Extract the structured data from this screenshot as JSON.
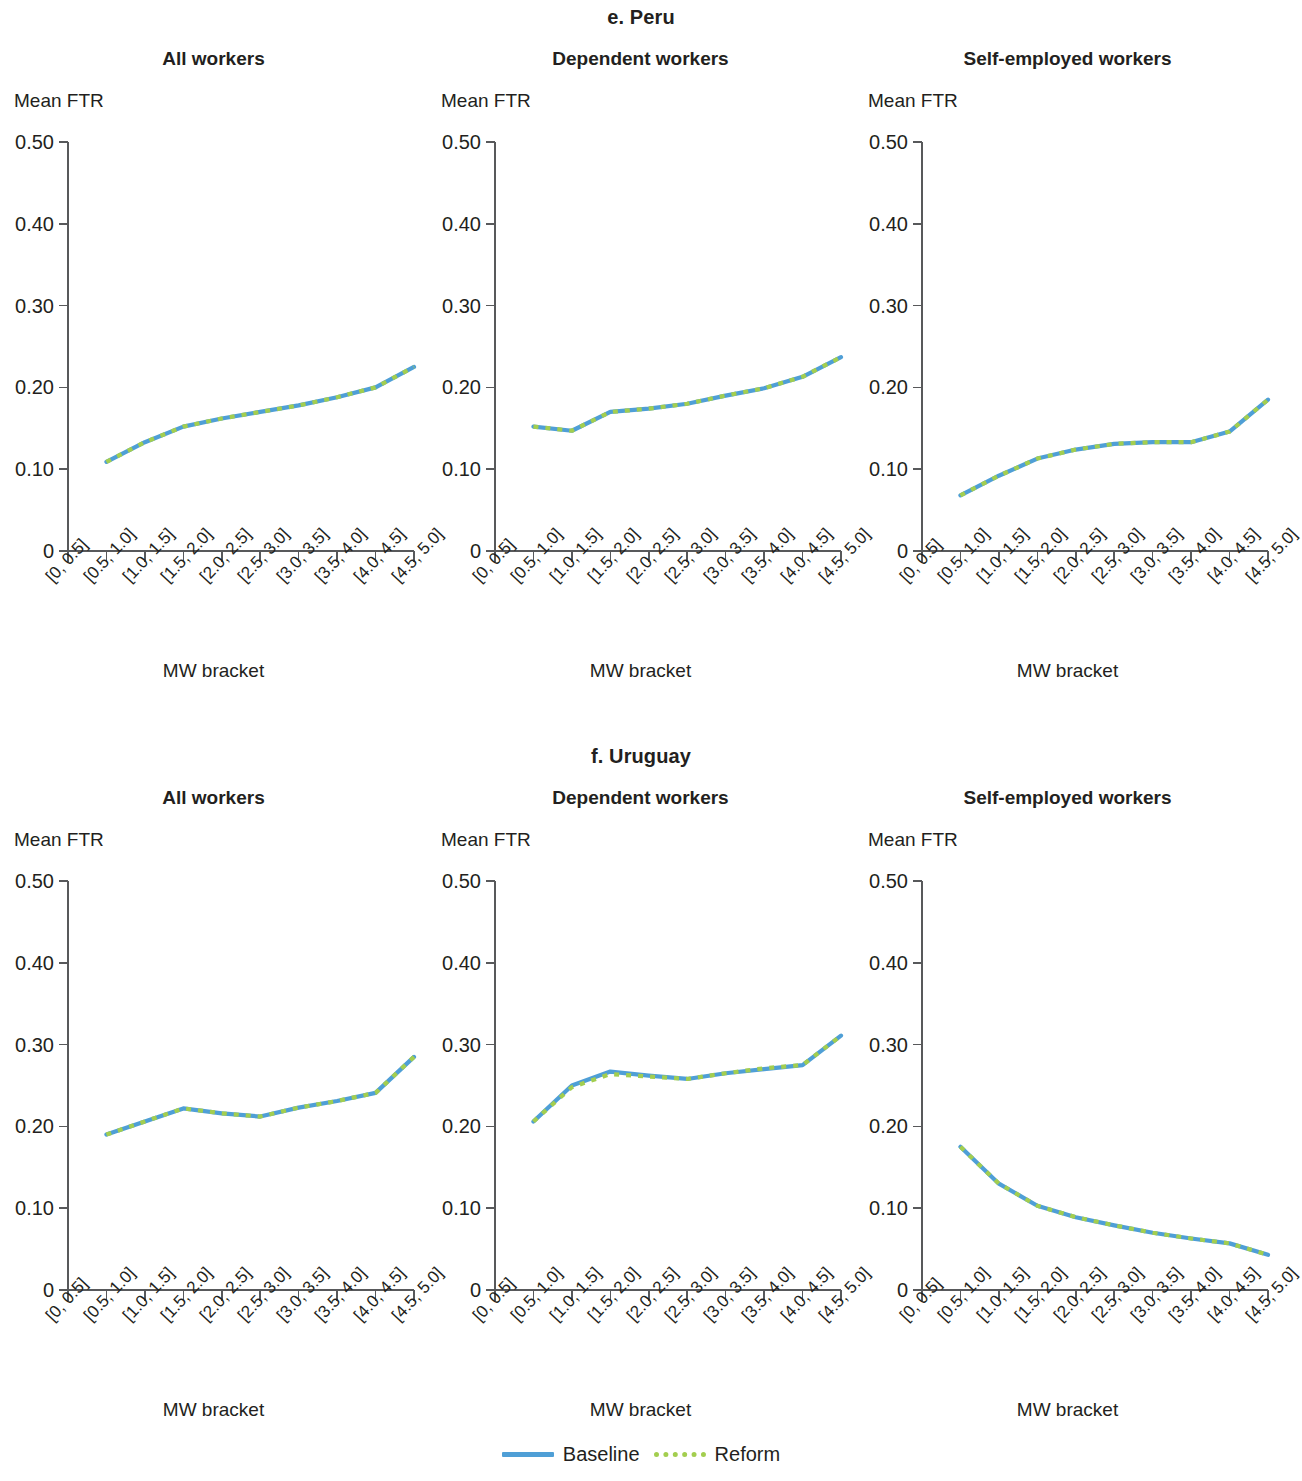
{
  "figure": {
    "sections": [
      {
        "id": "peru",
        "title": "e. Peru"
      },
      {
        "id": "uruguay",
        "title": "f. Uruguay"
      }
    ],
    "panel_titles": [
      "All workers",
      "Dependent workers",
      "Self-employed workers"
    ],
    "y_axis_label": "Mean FTR",
    "x_axis_label": "MW bracket",
    "y_ticks": [
      "0.50",
      "0.40",
      "0.30",
      "0.20",
      "0.10",
      "0"
    ],
    "x_ticks": [
      "[0, 0.5]",
      "[0.5, 1.0]",
      "[1.0, 1.5]",
      "[1.5, 2.0]",
      "[2.0, 2.5]",
      "[2.5, 3.0]",
      "[3.0, 3.5]",
      "[3.5, 4.0]",
      "[4.0, 4.5]",
      "[4.5, 5.0]"
    ],
    "legend": {
      "baseline_label": "Baseline",
      "reform_label": "Reform"
    },
    "colors": {
      "baseline": "#4f9fd6",
      "reform": "#a3ce4f",
      "axis": "#58595b",
      "text": "#231f20"
    }
  },
  "chart_data": [
    {
      "type": "line",
      "id": "peru-all",
      "title": "All workers",
      "section": "e. Peru",
      "xlabel": "MW bracket",
      "ylabel": "Mean FTR",
      "ylim": [
        0,
        0.5
      ],
      "yticks": [
        0,
        0.1,
        0.2,
        0.3,
        0.4,
        0.5
      ],
      "grid": false,
      "legend_position": "figure-bottom-center",
      "categories": [
        "[0, 0.5]",
        "[0.5, 1.0]",
        "[1.0, 1.5]",
        "[1.5, 2.0]",
        "[2.0, 2.5]",
        "[2.5, 3.0]",
        "[3.0, 3.5]",
        "[3.5, 4.0]",
        "[4.0, 4.5]",
        "[4.5, 5.0]"
      ],
      "series": [
        {
          "name": "Baseline",
          "values": [
            null,
            0.109,
            0.133,
            0.152,
            0.162,
            0.17,
            0.178,
            0.188,
            0.2,
            0.225
          ]
        },
        {
          "name": "Reform",
          "values": [
            null,
            0.109,
            0.133,
            0.152,
            0.162,
            0.17,
            0.178,
            0.188,
            0.2,
            0.225
          ]
        }
      ]
    },
    {
      "type": "line",
      "id": "peru-dependent",
      "title": "Dependent workers",
      "section": "e. Peru",
      "xlabel": "MW bracket",
      "ylabel": "Mean FTR",
      "ylim": [
        0,
        0.5
      ],
      "yticks": [
        0,
        0.1,
        0.2,
        0.3,
        0.4,
        0.5
      ],
      "grid": false,
      "legend_position": "figure-bottom-center",
      "categories": [
        "[0, 0.5]",
        "[0.5, 1.0]",
        "[1.0, 1.5]",
        "[1.5, 2.0]",
        "[2.0, 2.5]",
        "[2.5, 3.0]",
        "[3.0, 3.5]",
        "[3.5, 4.0]",
        "[4.0, 4.5]",
        "[4.5, 5.0]"
      ],
      "series": [
        {
          "name": "Baseline",
          "values": [
            null,
            0.152,
            0.147,
            0.17,
            0.174,
            0.18,
            0.19,
            0.199,
            0.213,
            0.237
          ]
        },
        {
          "name": "Reform",
          "values": [
            null,
            0.152,
            0.147,
            0.17,
            0.174,
            0.18,
            0.19,
            0.199,
            0.213,
            0.237
          ]
        }
      ]
    },
    {
      "type": "line",
      "id": "peru-self-employed",
      "title": "Self-employed workers",
      "section": "e. Peru",
      "xlabel": "MW bracket",
      "ylabel": "Mean FTR",
      "ylim": [
        0,
        0.5
      ],
      "yticks": [
        0,
        0.1,
        0.2,
        0.3,
        0.4,
        0.5
      ],
      "grid": false,
      "legend_position": "figure-bottom-center",
      "categories": [
        "[0, 0.5]",
        "[0.5, 1.0]",
        "[1.0, 1.5]",
        "[1.5, 2.0]",
        "[2.0, 2.5]",
        "[2.5, 3.0]",
        "[3.0, 3.5]",
        "[3.5, 4.0]",
        "[4.0, 4.5]",
        "[4.5, 5.0]"
      ],
      "series": [
        {
          "name": "Baseline",
          "values": [
            null,
            0.068,
            0.092,
            0.113,
            0.124,
            0.131,
            0.133,
            0.133,
            0.146,
            0.185
          ]
        },
        {
          "name": "Reform",
          "values": [
            null,
            0.068,
            0.092,
            0.113,
            0.124,
            0.131,
            0.133,
            0.133,
            0.146,
            0.185
          ]
        }
      ]
    },
    {
      "type": "line",
      "id": "uruguay-all",
      "title": "All workers",
      "section": "f. Uruguay",
      "xlabel": "MW bracket",
      "ylabel": "Mean FTR",
      "ylim": [
        0,
        0.5
      ],
      "yticks": [
        0,
        0.1,
        0.2,
        0.3,
        0.4,
        0.5
      ],
      "grid": false,
      "legend_position": "figure-bottom-center",
      "categories": [
        "[0, 0.5]",
        "[0.5, 1.0]",
        "[1.0, 1.5]",
        "[1.5, 2.0]",
        "[2.0, 2.5]",
        "[2.5, 3.0]",
        "[3.0, 3.5]",
        "[3.5, 4.0]",
        "[4.0, 4.5]",
        "[4.5, 5.0]"
      ],
      "series": [
        {
          "name": "Baseline",
          "values": [
            null,
            0.19,
            0.206,
            0.222,
            0.216,
            0.212,
            0.223,
            0.231,
            0.241,
            0.285
          ]
        },
        {
          "name": "Reform",
          "values": [
            null,
            0.19,
            0.206,
            0.222,
            0.216,
            0.212,
            0.223,
            0.231,
            0.241,
            0.285
          ]
        }
      ]
    },
    {
      "type": "line",
      "id": "uruguay-dependent",
      "title": "Dependent workers",
      "section": "f. Uruguay",
      "xlabel": "MW bracket",
      "ylabel": "Mean FTR",
      "ylim": [
        0,
        0.5
      ],
      "yticks": [
        0,
        0.1,
        0.2,
        0.3,
        0.4,
        0.5
      ],
      "grid": false,
      "legend_position": "figure-bottom-center",
      "categories": [
        "[0, 0.5]",
        "[0.5, 1.0]",
        "[1.0, 1.5]",
        "[1.5, 2.0]",
        "[2.0, 2.5]",
        "[2.5, 3.0]",
        "[3.0, 3.5]",
        "[3.5, 4.0]",
        "[4.0, 4.5]",
        "[4.5, 5.0]"
      ],
      "series": [
        {
          "name": "Baseline",
          "values": [
            null,
            0.206,
            0.25,
            0.267,
            0.262,
            0.258,
            0.265,
            0.27,
            0.275,
            0.311
          ]
        },
        {
          "name": "Reform",
          "values": [
            null,
            0.206,
            0.248,
            0.264,
            0.261,
            0.258,
            0.265,
            0.271,
            0.275,
            0.311
          ]
        }
      ]
    },
    {
      "type": "line",
      "id": "uruguay-self-employed",
      "title": "Self-employed workers",
      "section": "f. Uruguay",
      "xlabel": "MW bracket",
      "ylabel": "Mean FTR",
      "ylim": [
        0,
        0.5
      ],
      "yticks": [
        0,
        0.1,
        0.2,
        0.3,
        0.4,
        0.5
      ],
      "grid": false,
      "legend_position": "figure-bottom-center",
      "categories": [
        "[0, 0.5]",
        "[0.5, 1.0]",
        "[1.0, 1.5]",
        "[1.5, 2.0]",
        "[2.0, 2.5]",
        "[2.5, 3.0]",
        "[3.0, 3.5]",
        "[3.5, 4.0]",
        "[4.0, 4.5]",
        "[4.5, 5.0]"
      ],
      "series": [
        {
          "name": "Baseline",
          "values": [
            null,
            0.175,
            0.13,
            0.103,
            0.089,
            0.079,
            0.07,
            0.063,
            0.057,
            0.043
          ]
        },
        {
          "name": "Reform",
          "values": [
            null,
            0.175,
            0.13,
            0.103,
            0.089,
            0.079,
            0.07,
            0.063,
            0.057,
            0.043
          ]
        }
      ]
    }
  ]
}
